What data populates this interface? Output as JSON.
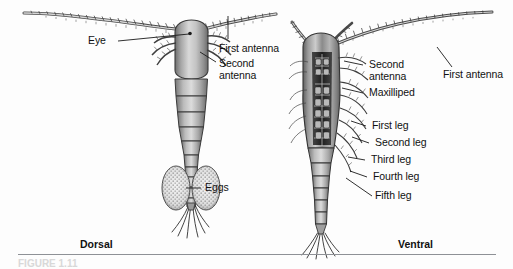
{
  "figure": {
    "caption": "FIGURE 1.11",
    "accent_ink": "#111111",
    "rule_color": "#8e9196",
    "background": "#fdfdfd"
  },
  "dorsal": {
    "orientation_label": "Dorsal",
    "labels": [
      {
        "id": "eye",
        "text": "Eye"
      },
      {
        "id": "first-antenna",
        "text": "First antenna"
      },
      {
        "id": "second-antenna",
        "text": "Second\nantenna"
      },
      {
        "id": "eggs",
        "text": "Eggs"
      }
    ]
  },
  "ventral": {
    "orientation_label": "Ventral",
    "labels": [
      {
        "id": "second-antenna",
        "text": "Second\nantenna"
      },
      {
        "id": "maxilliped",
        "text": "Maxilliped"
      },
      {
        "id": "first-antenna",
        "text": "First antenna"
      },
      {
        "id": "first-leg",
        "text": "First leg"
      },
      {
        "id": "second-leg",
        "text": "Second leg"
      },
      {
        "id": "third-leg",
        "text": "Third leg"
      },
      {
        "id": "fourth-leg",
        "text": "Fourth leg"
      },
      {
        "id": "fifth-leg",
        "text": "Fifth leg"
      }
    ]
  },
  "subject": {
    "organism": "copepod",
    "views": [
      "Dorsal",
      "Ventral"
    ]
  }
}
